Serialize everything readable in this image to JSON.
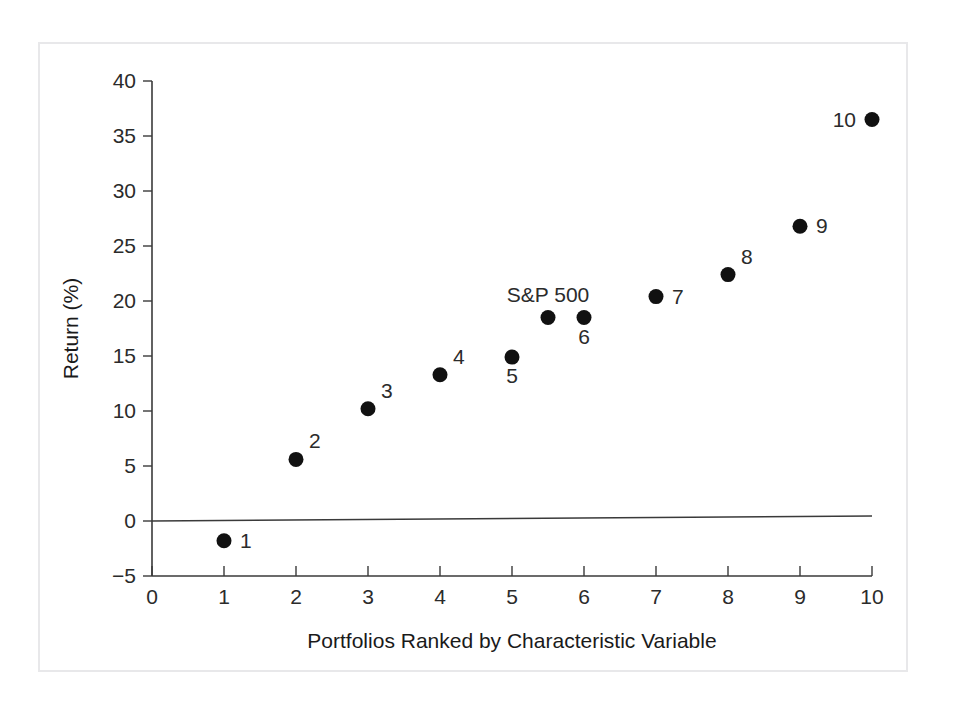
{
  "chart_data": {
    "type": "scatter",
    "title": "",
    "xlabel": "Portfolios Ranked by Characteristic Variable",
    "ylabel": "Return (%)",
    "xlim": [
      0,
      10
    ],
    "ylim": [
      -5,
      40
    ],
    "grid": false,
    "legend": null,
    "x_ticks": [
      "0",
      "1",
      "2",
      "3",
      "4",
      "5",
      "6",
      "7",
      "8",
      "9",
      "10"
    ],
    "y_ticks": [
      "-5",
      "0",
      "5",
      "10",
      "15",
      "20",
      "25",
      "30",
      "35",
      "40"
    ],
    "zero_line": 0,
    "points": [
      {
        "label": "1",
        "x": 1,
        "y": -1.8,
        "label_pos": "right"
      },
      {
        "label": "2",
        "x": 2,
        "y": 5.6,
        "label_pos": "upper-right"
      },
      {
        "label": "3",
        "x": 3,
        "y": 10.2,
        "label_pos": "upper-right"
      },
      {
        "label": "4",
        "x": 4,
        "y": 13.3,
        "label_pos": "upper-right"
      },
      {
        "label": "5",
        "x": 5,
        "y": 14.9,
        "label_pos": "below"
      },
      {
        "label": "S&P 500",
        "x": 5.5,
        "y": 18.5,
        "label_pos": "above"
      },
      {
        "label": "6",
        "x": 6,
        "y": 18.5,
        "label_pos": "below"
      },
      {
        "label": "7",
        "x": 7,
        "y": 20.4,
        "label_pos": "right"
      },
      {
        "label": "8",
        "x": 8,
        "y": 22.4,
        "label_pos": "upper-right"
      },
      {
        "label": "9",
        "x": 9,
        "y": 26.8,
        "label_pos": "right"
      },
      {
        "label": "10",
        "x": 10,
        "y": 36.5,
        "label_pos": "left"
      }
    ]
  },
  "colors": {
    "marker": "#111111",
    "axis": "#3a3a3a",
    "text": "#2b2b2b",
    "frame": "#e8e8ea",
    "background": "#ffffff"
  }
}
